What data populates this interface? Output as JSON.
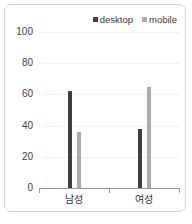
{
  "chart_data": {
    "type": "bar",
    "title": "",
    "subtitle": "",
    "xlabel": "",
    "ylabel": "",
    "categories": [
      "남성",
      "여성"
    ],
    "series": [
      {
        "name": "desktop",
        "color": "#3f3f3f",
        "values": [
          62,
          38
        ]
      },
      {
        "name": "mobile",
        "color": "#ababab",
        "values": [
          36,
          65
        ]
      }
    ],
    "ylim": [
      0,
      100
    ],
    "yticks": [
      0,
      20,
      40,
      60,
      80,
      100
    ],
    "ytick_labels": [
      "0",
      "20",
      "40",
      "60",
      "80",
      "100"
    ],
    "grid": true,
    "grid_axis": "y",
    "legend_position": "top-right",
    "legend": [
      {
        "label": "desktop",
        "marker": "square",
        "color": "#3f3f3f"
      },
      {
        "label": "mobile",
        "marker": "square",
        "color": "#ababab"
      }
    ]
  },
  "frame": {
    "border_color": "#d6d6d6",
    "background": "#ffffff"
  },
  "axis": {
    "line_color": "#9a9a9a",
    "gridline_color": "#efefef",
    "tick_label_color": "#444444"
  }
}
